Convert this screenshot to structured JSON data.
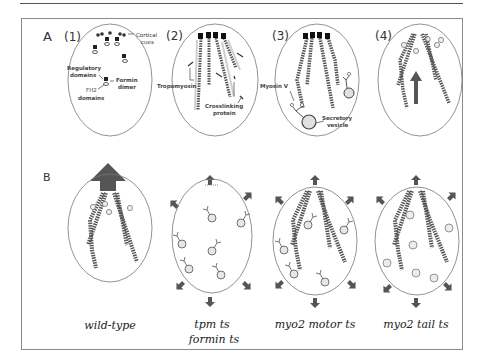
{
  "figure": {
    "colors": {
      "frame": "#8a8a8a",
      "rule": "#555555",
      "ellipse": "#666666",
      "filament": "#444444",
      "arrow": "#555555",
      "vesicle_fill": "#d9d9d9",
      "text": "#333333"
    },
    "panel_a": {
      "label": "A",
      "steps": [
        {
          "number": "(1)",
          "annotations": {
            "cortical": "Cortical",
            "cues": "cues",
            "regulatory": "Regulatory",
            "domains": "domains",
            "formin": "Formin",
            "dimer": "dimer",
            "fh2": "FH2",
            "fh2_domains": "domains"
          }
        },
        {
          "number": "(2)",
          "annotations": {
            "tropomyosin": "Tropomyosin",
            "crosslinking": "Crosslinking",
            "protein": "protein"
          }
        },
        {
          "number": "(3)",
          "annotations": {
            "myosin": "Myosin V",
            "secretory": "Secretory",
            "vesicle": "vesicle"
          }
        },
        {
          "number": "(4)",
          "annotations": {}
        }
      ]
    },
    "panel_b": {
      "label": "B",
      "conditions": [
        {
          "caption_line1": "wild-type",
          "caption_line2": ""
        },
        {
          "caption_line1": "tpm ts",
          "caption_line2": "formin ts"
        },
        {
          "caption_line1": "myo2 motor ts",
          "caption_line2": ""
        },
        {
          "caption_line1": "myo2 tail ts",
          "caption_line2": ""
        }
      ]
    }
  }
}
